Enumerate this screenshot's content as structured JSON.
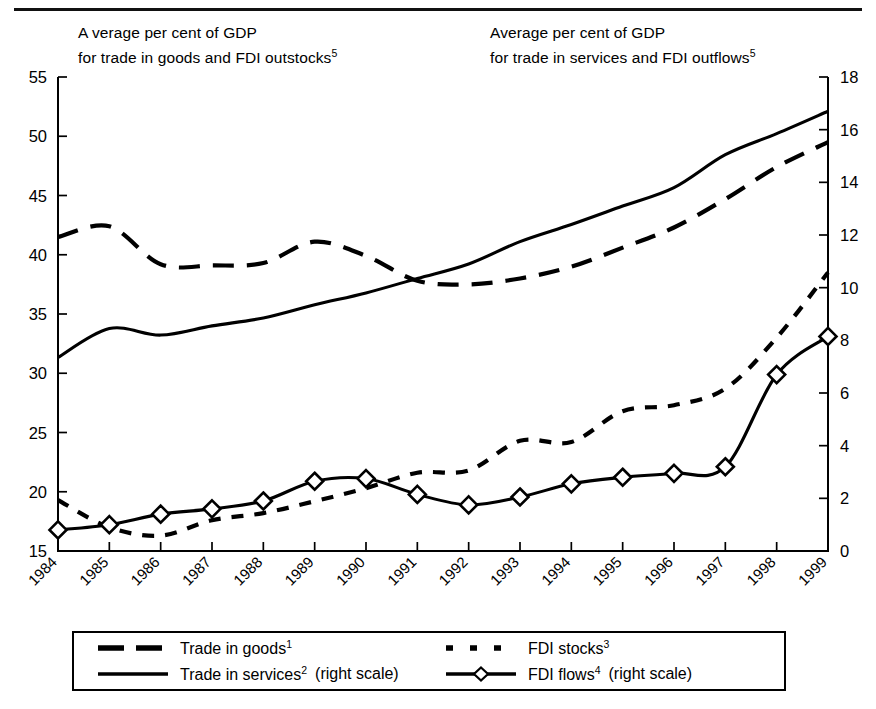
{
  "titles": {
    "left": "A verage per cent of GDP\nfor trade in goods and FDI outstocks",
    "left_sup": "5",
    "right": "Average per cent of GDP\nfor trade in services and FDI outflows",
    "right_sup": "5"
  },
  "legend": {
    "items": [
      {
        "key": "goods",
        "label": "Trade in goods",
        "sup": "1",
        "scale_note": "",
        "style": "dashed-long"
      },
      {
        "key": "services",
        "label": "Trade in services",
        "sup": "2",
        "scale_note": "(right scale)",
        "style": "solid"
      },
      {
        "key": "stocks",
        "label": "FDI stocks",
        "sup": "3",
        "scale_note": "",
        "style": "dotted"
      },
      {
        "key": "flows",
        "label": "FDI flows",
        "sup": "4",
        "scale_note": "(right scale)",
        "style": "solid-diamond"
      }
    ]
  },
  "chart_data": {
    "type": "line",
    "title": "",
    "xlabel": "",
    "grid": false,
    "legend_position": "bottom",
    "x": [
      1984,
      1985,
      1986,
      1987,
      1988,
      1989,
      1990,
      1991,
      1992,
      1993,
      1994,
      1995,
      1996,
      1997,
      1998,
      1999
    ],
    "categories": [
      "1984",
      "1985",
      "1986",
      "1987",
      "1988",
      "1989",
      "1990",
      "1991",
      "1992",
      "1993",
      "1994",
      "1995",
      "1996",
      "1997",
      "1998",
      "1999"
    ],
    "left_axis": {
      "label": "A verage per cent of GDP for trade in goods and FDI outstocks",
      "ylim": [
        15,
        55
      ],
      "ticks": [
        15,
        20,
        25,
        30,
        35,
        40,
        45,
        50,
        55
      ]
    },
    "right_axis": {
      "label": "Average per cent of GDP for trade in services and FDI outflows",
      "ylim": [
        0,
        18
      ],
      "ticks": [
        0,
        2,
        4,
        6,
        8,
        10,
        12,
        14,
        16,
        18
      ]
    },
    "series": [
      {
        "name": "Trade in goods",
        "footnote": "1",
        "axis": "left",
        "style": "dashed-long",
        "markers": false,
        "values": [
          41.5,
          42.4,
          39.2,
          39.1,
          39.3,
          41.1,
          39.9,
          37.8,
          37.5,
          38.0,
          39.0,
          40.6,
          42.3,
          44.7,
          47.4,
          49.5
        ]
      },
      {
        "name": "Trade in services",
        "footnote": "2",
        "axis": "right",
        "style": "solid",
        "markers": false,
        "values": [
          7.35,
          8.45,
          8.2,
          8.55,
          8.85,
          9.35,
          9.8,
          10.35,
          10.9,
          11.75,
          12.4,
          13.1,
          13.8,
          15.05,
          15.85,
          16.7
        ]
      },
      {
        "name": "FDI stocks",
        "footnote": "3",
        "axis": "left",
        "style": "dotted",
        "markers": false,
        "values": [
          19.3,
          17.0,
          16.3,
          17.6,
          18.2,
          19.2,
          20.3,
          21.6,
          21.8,
          24.3,
          24.2,
          26.8,
          27.3,
          28.7,
          33.0,
          38.5
        ]
      },
      {
        "name": "FDI flows",
        "footnote": "4",
        "axis": "right",
        "style": "solid-diamond",
        "markers": true,
        "values": [
          0.8,
          1.0,
          1.4,
          1.6,
          1.9,
          2.65,
          2.75,
          2.15,
          1.75,
          2.05,
          2.55,
          2.8,
          2.95,
          3.2,
          6.7,
          8.15
        ]
      }
    ]
  }
}
